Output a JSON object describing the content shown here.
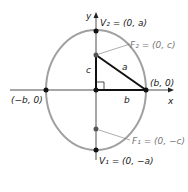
{
  "diagram": {
    "axes": {
      "x_label": "x",
      "y_label": "y"
    },
    "ellipse_color": "#a0a0a0",
    "points": {
      "v2": "V₂ = (0, a)",
      "v1": "V₁ = (0, −a)",
      "f2": "F₂ = (0, c)",
      "f1": "F₁ = (0, −c)",
      "right_vertex": "(b, 0)",
      "left_vertex": "(−b, 0)"
    },
    "triangle": {
      "side_c": "c",
      "side_a": "a",
      "side_b": "b"
    }
  }
}
